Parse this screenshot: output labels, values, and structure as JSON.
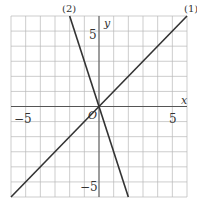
{
  "chart_data": {
    "type": "line",
    "title": "",
    "xlabel": "x",
    "ylabel": "y",
    "origin_label": "O",
    "xlim": [
      -6,
      6
    ],
    "ylim": [
      -6,
      6
    ],
    "grid": true,
    "grid_step": 1,
    "x_ticks": [
      {
        "value": -5,
        "label": "−5"
      },
      {
        "value": 5,
        "label": "5"
      }
    ],
    "y_ticks": [
      {
        "value": 5,
        "label": "5"
      },
      {
        "value": -5,
        "label": "−5"
      }
    ],
    "series": [
      {
        "name": "(1)",
        "equation": "y = x",
        "slope": 1,
        "points": [
          [
            -6,
            -6
          ],
          [
            6,
            6
          ]
        ]
      },
      {
        "name": "(2)",
        "equation": "y = -3x",
        "slope": -3,
        "points": [
          [
            -2,
            6
          ],
          [
            2,
            -6
          ]
        ]
      }
    ],
    "colors": {
      "grid": "#b8b8b8",
      "axis": "#555555",
      "line": "#333333"
    }
  }
}
